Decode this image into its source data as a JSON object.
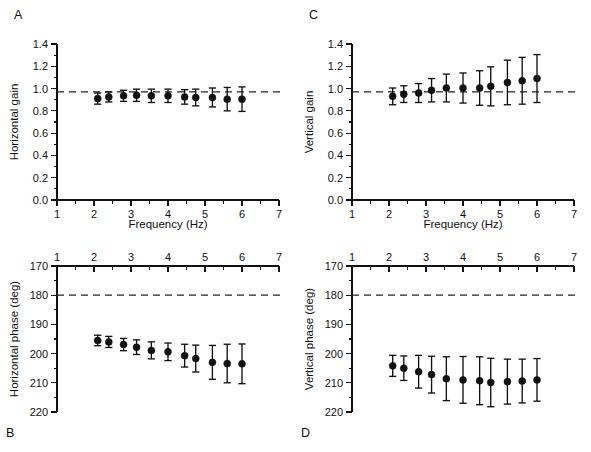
{
  "figure": {
    "background": "#ffffff",
    "ink": "#111111"
  },
  "panels": [
    {
      "id": "panel-a",
      "letter": "A",
      "letter_position": "top-left",
      "ylabel": "Horizontal gain",
      "xlabel": "Frequency (Hz)",
      "xaxis_position": "bottom",
      "yaxis_inverted": false,
      "reference_line_value": 0.97,
      "xlim": [
        1,
        7
      ],
      "ylim": [
        0.0,
        1.4
      ],
      "xticks": [
        1,
        2,
        3,
        4,
        5,
        6,
        7
      ],
      "xticklabels": [
        "1",
        "2",
        "3",
        "4",
        "5",
        "6",
        "7"
      ],
      "xminor_step": 0.5,
      "yticks": [
        0.0,
        0.2,
        0.4,
        0.6,
        0.8,
        1.0,
        1.2,
        1.4
      ],
      "yticklabels": [
        "0.0",
        "0.2",
        "0.4",
        "0.6",
        "0.8",
        "1.0",
        "1.2",
        "1.4"
      ],
      "yminor_step": 0.1
    },
    {
      "id": "panel-c",
      "letter": "C",
      "letter_position": "top-left",
      "ylabel": "Vertical gain",
      "xlabel": "Frequency (Hz)",
      "xaxis_position": "bottom",
      "yaxis_inverted": false,
      "reference_line_value": 0.97,
      "xlim": [
        1,
        7
      ],
      "ylim": [
        0.0,
        1.4
      ],
      "xticks": [
        1,
        2,
        3,
        4,
        5,
        6,
        7
      ],
      "xticklabels": [
        "1",
        "2",
        "3",
        "4",
        "5",
        "6",
        "7"
      ],
      "xminor_step": 0.5,
      "yticks": [
        0.0,
        0.2,
        0.4,
        0.6,
        0.8,
        1.0,
        1.2,
        1.4
      ],
      "yticklabels": [
        "0.0",
        "0.2",
        "0.4",
        "0.6",
        "0.8",
        "1.0",
        "1.2",
        "1.4"
      ],
      "yminor_step": 0.1
    },
    {
      "id": "panel-b",
      "letter": "B",
      "letter_position": "bottom-left",
      "ylabel": "Horizontal phase (deg)",
      "xlabel": "",
      "xaxis_position": "top",
      "yaxis_inverted": true,
      "reference_line_value": 180,
      "xlim": [
        1,
        7
      ],
      "ylim": [
        170,
        220
      ],
      "xticks": [
        1,
        2,
        3,
        4,
        5,
        6,
        7
      ],
      "xticklabels": [
        "1",
        "2",
        "3",
        "4",
        "5",
        "6",
        "7"
      ],
      "xminor_step": 0.5,
      "yticks": [
        170,
        180,
        190,
        200,
        210,
        220
      ],
      "yticklabels": [
        "170",
        "180",
        "190",
        "200",
        "210",
        "220"
      ],
      "yminor_step": 5
    },
    {
      "id": "panel-d",
      "letter": "D",
      "letter_position": "bottom-left",
      "ylabel": "Vertical phase (deg)",
      "xlabel": "",
      "xaxis_position": "top",
      "yaxis_inverted": true,
      "reference_line_value": 180,
      "xlim": [
        1,
        7
      ],
      "ylim": [
        170,
        220
      ],
      "xticks": [
        1,
        2,
        3,
        4,
        5,
        6,
        7
      ],
      "xticklabels": [
        "1",
        "2",
        "3",
        "4",
        "5",
        "6",
        "7"
      ],
      "xminor_step": 0.5,
      "yticks": [
        170,
        180,
        190,
        200,
        210,
        220
      ],
      "yticklabels": [
        "170",
        "180",
        "190",
        "200",
        "210",
        "220"
      ],
      "yminor_step": 5
    }
  ],
  "chart_data": [
    {
      "type": "scatter",
      "panel": "A",
      "title": "",
      "xlabel": "Frequency (Hz)",
      "ylabel": "Horizontal gain",
      "xlim": [
        1,
        7
      ],
      "ylim": [
        0.0,
        1.4
      ],
      "grid": false,
      "legend": "none",
      "errorbars": true,
      "reference_line": {
        "y": 0.97,
        "style": "dashed"
      },
      "x": [
        2.1,
        2.4,
        2.8,
        3.15,
        3.55,
        4.0,
        4.45,
        4.75,
        5.2,
        5.6,
        6.0
      ],
      "y": [
        0.91,
        0.925,
        0.935,
        0.94,
        0.935,
        0.935,
        0.925,
        0.92,
        0.92,
        0.905,
        0.905
      ],
      "yerr": [
        0.05,
        0.045,
        0.05,
        0.055,
        0.06,
        0.06,
        0.065,
        0.075,
        0.085,
        0.105,
        0.11
      ]
    },
    {
      "type": "scatter",
      "panel": "C",
      "title": "",
      "xlabel": "Frequency (Hz)",
      "ylabel": "Vertical gain",
      "xlim": [
        1,
        7
      ],
      "ylim": [
        0.0,
        1.4
      ],
      "grid": false,
      "legend": "none",
      "errorbars": true,
      "reference_line": {
        "y": 0.97,
        "style": "dashed"
      },
      "x": [
        2.1,
        2.4,
        2.8,
        3.15,
        3.55,
        4.0,
        4.45,
        4.75,
        5.2,
        5.6,
        6.0
      ],
      "y": [
        0.93,
        0.95,
        0.96,
        0.985,
        1.005,
        1.005,
        1.005,
        1.02,
        1.055,
        1.07,
        1.09
      ],
      "yerr": [
        0.075,
        0.075,
        0.085,
        0.105,
        0.125,
        0.135,
        0.155,
        0.175,
        0.2,
        0.21,
        0.215
      ]
    },
    {
      "type": "scatter",
      "panel": "B",
      "title": "",
      "xlabel": "Frequency (Hz)",
      "ylabel": "Horizontal phase (deg)",
      "xlim": [
        1,
        7
      ],
      "ylim": [
        170,
        220
      ],
      "y_inverted": true,
      "grid": false,
      "legend": "none",
      "errorbars": true,
      "reference_line": {
        "y": 180,
        "style": "dashed"
      },
      "x": [
        2.1,
        2.4,
        2.8,
        3.15,
        3.55,
        4.0,
        4.45,
        4.75,
        5.2,
        5.6,
        6.0
      ],
      "y": [
        195.5,
        196.0,
        196.9,
        197.8,
        198.9,
        199.4,
        200.7,
        201.7,
        203.0,
        203.4,
        203.5
      ],
      "yerr": [
        1.8,
        1.9,
        2.1,
        2.5,
        2.9,
        3.0,
        3.9,
        4.6,
        5.8,
        6.6,
        6.8
      ]
    },
    {
      "type": "scatter",
      "panel": "D",
      "title": "",
      "xlabel": "Frequency (Hz)",
      "ylabel": "Vertical phase (deg)",
      "xlim": [
        170,
        220
      ],
      "ylim": [
        170,
        220
      ],
      "y_inverted": true,
      "grid": false,
      "legend": "none",
      "errorbars": true,
      "reference_line": {
        "y": 180,
        "style": "dashed"
      },
      "x": [
        2.1,
        2.4,
        2.8,
        3.15,
        3.55,
        4.0,
        4.45,
        4.75,
        5.2,
        5.6,
        6.0
      ],
      "y": [
        204.2,
        205.0,
        206.2,
        207.2,
        208.6,
        209.0,
        209.3,
        209.9,
        209.6,
        209.4,
        209.0
      ],
      "yerr": [
        3.6,
        4.2,
        5.6,
        6.3,
        7.5,
        8.0,
        8.2,
        8.3,
        7.7,
        7.5,
        7.3
      ]
    }
  ]
}
